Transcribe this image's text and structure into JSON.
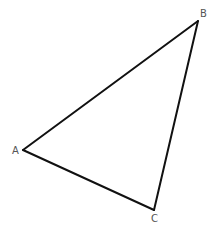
{
  "diagram": {
    "type": "triangle",
    "vertices": [
      {
        "label": "A"
      },
      {
        "label": "B"
      },
      {
        "label": "C"
      }
    ],
    "edges": [
      {
        "from": "A",
        "to": "B"
      },
      {
        "from": "B",
        "to": "C"
      },
      {
        "from": "C",
        "to": "A"
      }
    ],
    "stroke_color": "#111111",
    "label_color": "#555555"
  }
}
